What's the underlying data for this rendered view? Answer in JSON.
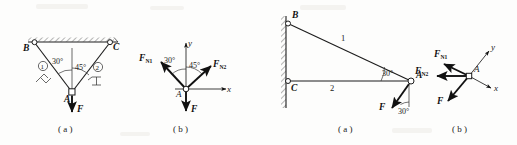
{
  "sheet": {
    "background": "#fdfdfc",
    "ink": "#1a1a1a",
    "width": 517,
    "height": 145
  },
  "figures": [
    {
      "id": "figure-left",
      "caption_a": "( a )",
      "caption_b": "( b )",
      "panel_a": {
        "name": "two-bar-truss-under-ceiling",
        "joints": [
          {
            "label": "B",
            "role": "pin-support-left"
          },
          {
            "label": "C",
            "role": "pin-support-right"
          },
          {
            "label": "A",
            "role": "loaded-joint"
          }
        ],
        "members": [
          {
            "label": "①",
            "name": "member-one",
            "from": "B",
            "to": "A"
          },
          {
            "label": "②",
            "name": "member-two",
            "from": "C",
            "to": "A"
          }
        ],
        "angles": [
          {
            "label": "30°",
            "at": "A",
            "between": "member-1 and vertical"
          },
          {
            "label": "45°",
            "at": "A",
            "between": "vertical and member-2"
          }
        ],
        "load": {
          "label": "F",
          "direction": "downward",
          "at": "A"
        },
        "support_type": "hatched-ceiling"
      },
      "panel_b": {
        "name": "free-body-diagram-joint-A",
        "origin_label": "A",
        "axes": [
          {
            "label": "x",
            "direction": "right"
          },
          {
            "label": "y",
            "direction": "up"
          }
        ],
        "forces": [
          {
            "base": "F",
            "sub": "N1",
            "direction": "up-left",
            "angle": "30°"
          },
          {
            "base": "F",
            "sub": "N2",
            "direction": "up-right",
            "angle": "45°"
          },
          {
            "base": "F",
            "sub": "",
            "direction": "down",
            "angle": ""
          }
        ],
        "angles": [
          {
            "label": "30°"
          },
          {
            "label": "45°"
          }
        ]
      }
    },
    {
      "id": "figure-right",
      "caption_a": "( a )",
      "caption_b": "( b )",
      "panel_a": {
        "name": "wall-bracket-truss",
        "joints": [
          {
            "label": "B",
            "role": "pin-support-upper-wall"
          },
          {
            "label": "C",
            "role": "pin-support-lower-wall"
          },
          {
            "label": "A",
            "role": "loaded-joint"
          }
        ],
        "members": [
          {
            "label": "1",
            "name": "member-one",
            "from": "B",
            "to": "A"
          },
          {
            "label": "2",
            "name": "member-two",
            "from": "C",
            "to": "A"
          }
        ],
        "angles": [
          {
            "label": "30°",
            "at": "A",
            "between": "member-1 and member-2"
          },
          {
            "label": "30°",
            "at": "A",
            "between": "load F and vertical"
          }
        ],
        "load": {
          "label": "F",
          "direction": "down-left-inclined",
          "at": "A"
        },
        "support_type": "hatched-vertical-wall"
      },
      "panel_b": {
        "name": "free-body-diagram-joint-A",
        "origin_label": "A",
        "axes": [
          {
            "label": "x",
            "direction": "down-right"
          },
          {
            "label": "y",
            "direction": "up-right"
          }
        ],
        "forces": [
          {
            "base": "F",
            "sub": "N1",
            "direction": "up-left",
            "angle": ""
          },
          {
            "base": "F",
            "sub": "N2",
            "direction": "left",
            "angle": ""
          },
          {
            "base": "F",
            "sub": "",
            "direction": "down-left",
            "angle": ""
          }
        ]
      }
    }
  ]
}
